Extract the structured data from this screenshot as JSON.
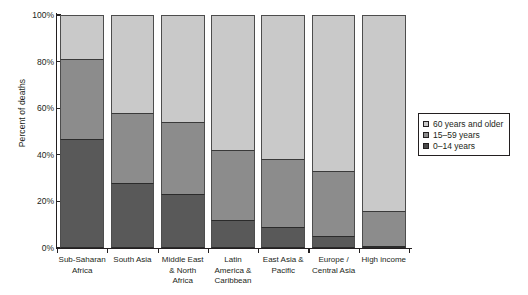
{
  "chart_data": {
    "type": "bar",
    "subtype": "stacked-bar-100-percent",
    "title": "",
    "xlabel": "",
    "ylabel": "Percent of deaths",
    "ylim": [
      0,
      100
    ],
    "yticks": [
      "0%",
      "20%",
      "40%",
      "60%",
      "80%",
      "100%"
    ],
    "ytick_values": [
      0,
      20,
      40,
      60,
      80,
      100
    ],
    "grid": false,
    "legend_position": "right",
    "categories": [
      "Sub-Saharan Africa",
      "South Asia",
      "Middle East & North Africa",
      "Latin America & Caribbean",
      "East Asia & Pacific",
      "Europe / Central Asia",
      "High income"
    ],
    "category_label_lines": [
      [
        "Sub-Saharan",
        "Africa"
      ],
      [
        "South Asia"
      ],
      [
        "Middle East",
        "& North",
        "Africa"
      ],
      [
        "Latin",
        "America &",
        "Caribbean"
      ],
      [
        "East Asia &",
        "Pacific"
      ],
      [
        "Europe /",
        "Central Asia"
      ],
      [
        "High income"
      ]
    ],
    "series": [
      {
        "name": "0–14 years",
        "color": "#595959",
        "values": [
          47,
          28,
          23,
          12,
          9,
          5,
          1
        ]
      },
      {
        "name": "15–59 years",
        "color": "#8c8c8c",
        "values": [
          34,
          30,
          31,
          30,
          29,
          28,
          15
        ]
      },
      {
        "name": "60 years and older",
        "color": "#c9c9c9",
        "values": [
          19,
          42,
          46,
          58,
          62,
          67,
          84
        ]
      }
    ],
    "cumulative_tops": {
      "0-14": [
        47,
        28,
        23,
        12,
        9,
        5,
        1
      ],
      "15-59": [
        81,
        58,
        54,
        42,
        38,
        33,
        16
      ],
      "60+": [
        100,
        100,
        100,
        100,
        100,
        100,
        100
      ]
    }
  },
  "legend": {
    "entries": [
      {
        "label": "60 years and older",
        "swatch": "legend-swatch-60-plus"
      },
      {
        "label": "15–59 years",
        "swatch": "legend-swatch-15-59"
      },
      {
        "label": "0–14 years",
        "swatch": "legend-swatch-0-14"
      }
    ]
  },
  "axes": {
    "y_title": "Percent of deaths"
  }
}
